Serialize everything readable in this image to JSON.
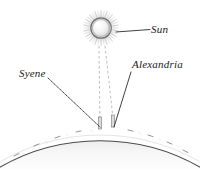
{
  "figure": {
    "background_color": "#ffffff",
    "ink_color": "#1a1a1a",
    "width": 200,
    "height": 170
  },
  "labels": {
    "sun": "Sun",
    "alexandria": "Alexandria",
    "syene": "Syene"
  },
  "icons": {
    "sun": "sun-icon",
    "earth": "earth-arc-icon",
    "gnomon_syene": "gnomon-icon",
    "gnomon_alexandria": "gnomon-icon"
  },
  "diagram_data": {
    "type": "schematic",
    "sun": {
      "center_x": 101,
      "center_y": 28,
      "disc_radius": 9,
      "halo_radius": 17,
      "ray_count": 44
    },
    "earth": {
      "arc_center_x": 100,
      "arc_center_y": 330,
      "arc_radius": 202,
      "surface_apex_y": 128,
      "shade_color": "#f2f2f2",
      "edge_color": "#3a3a3a"
    },
    "gnomons": [
      {
        "name": "syene",
        "x": 100,
        "base_y": 129,
        "top_y": 118,
        "width": 3
      },
      {
        "name": "alexandria",
        "x": 113,
        "base_y": 127,
        "top_y": 116,
        "width": 3
      }
    ],
    "sun_rays": [
      {
        "name": "ray-to-syene",
        "x1": 99,
        "y1": 46,
        "x2": 100,
        "y2": 128,
        "style": "dashed"
      },
      {
        "name": "ray-to-alexandria",
        "x1": 105,
        "y1": 46,
        "x2": 114,
        "y2": 127,
        "style": "dashed"
      }
    ],
    "leader_lines": [
      {
        "name": "leader-sun",
        "x1": 116,
        "y1": 32,
        "x2": 150,
        "y2": 30,
        "style": "solid"
      },
      {
        "name": "leader-alexandria",
        "x1": 131,
        "y1": 72,
        "x2": 114,
        "y2": 127,
        "style": "solid"
      },
      {
        "name": "leader-syene",
        "x1": 48,
        "y1": 78,
        "x2": 100,
        "y2": 127,
        "style": "dotted"
      }
    ],
    "surface_marks": 9
  }
}
